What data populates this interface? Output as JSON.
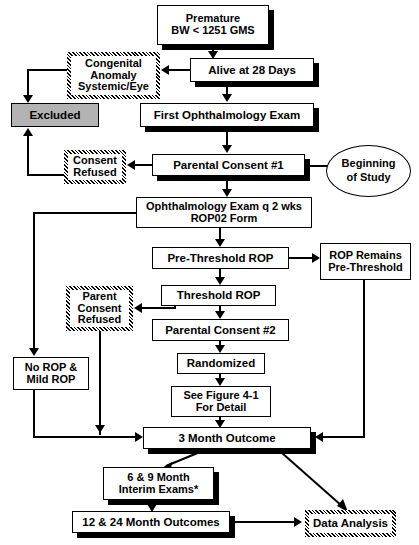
{
  "diagram": {
    "type": "flowchart",
    "colors": {
      "line": "#000000",
      "box_fill": "#ffffff",
      "excluded_fill": "#b3b3b3",
      "text": "#000000"
    },
    "nodes": [
      {
        "id": "premature",
        "label": "Premature\nBW < 1251 GMS",
        "style": "shadow",
        "x": 157,
        "y": 5,
        "w": 112,
        "h": 40,
        "font": 11
      },
      {
        "id": "congenital",
        "label": "Congenital\nAnomaly\nSystemic/Eye",
        "style": "hatch",
        "x": 67,
        "y": 52,
        "w": 93,
        "h": 47,
        "font": 11
      },
      {
        "id": "alive28",
        "label": "Alive at 28 Days",
        "style": "shadow",
        "x": 190,
        "y": 58,
        "w": 124,
        "h": 24,
        "font": 11.5
      },
      {
        "id": "excluded",
        "label": "Excluded",
        "style": "filled",
        "x": 11,
        "y": 103,
        "w": 88,
        "h": 24,
        "font": 11.5
      },
      {
        "id": "first_exam",
        "label": "First Ophthalmology  Exam",
        "style": "shadow",
        "x": 140,
        "y": 103,
        "w": 174,
        "h": 24,
        "font": 11.5
      },
      {
        "id": "consent_refused1",
        "label": "Consent\nRefused",
        "style": "hatch",
        "x": 64,
        "y": 150,
        "w": 62,
        "h": 34,
        "font": 11
      },
      {
        "id": "parental1",
        "label": "Parental Consent #1",
        "style": "shadow",
        "x": 152,
        "y": 154,
        "w": 153,
        "h": 22,
        "font": 11.5
      },
      {
        "id": "beginning",
        "label": "Beginning\nof Study",
        "style": "ellipse",
        "x": 326,
        "y": 145,
        "w": 85,
        "h": 52,
        "font": 11
      },
      {
        "id": "ophth_q2",
        "label": "Ophthalmology Exam q 2 wks\nROP02 Form",
        "style": "plain",
        "x": 136,
        "y": 197,
        "w": 176,
        "h": 31,
        "font": 11
      },
      {
        "id": "prethreshold",
        "label": "Pre-Threshold ROP",
        "style": "plain",
        "x": 152,
        "y": 247,
        "w": 137,
        "h": 22,
        "font": 11.5
      },
      {
        "id": "rop_remains",
        "label": "ROP Remains\nPre-Threshold",
        "style": "plain",
        "x": 320,
        "y": 243,
        "w": 91,
        "h": 37,
        "font": 11
      },
      {
        "id": "threshold",
        "label": "Threshold ROP",
        "style": "plain",
        "x": 161,
        "y": 285,
        "w": 115,
        "h": 21,
        "font": 11.5
      },
      {
        "id": "parent_refused2",
        "label": "Parent\nConsent\nRefused",
        "style": "hatch",
        "x": 66,
        "y": 286,
        "w": 67,
        "h": 45,
        "font": 11
      },
      {
        "id": "parental2",
        "label": "Parental Consent #2",
        "style": "plain",
        "x": 152,
        "y": 319,
        "w": 137,
        "h": 22,
        "font": 11.5
      },
      {
        "id": "randomized",
        "label": "Randomized",
        "style": "plain",
        "x": 177,
        "y": 353,
        "w": 88,
        "h": 21,
        "font": 11.5
      },
      {
        "id": "see_figure",
        "label": "See Figure 4-1\nFor Detail",
        "style": "plain",
        "x": 171,
        "y": 386,
        "w": 100,
        "h": 31,
        "font": 11
      },
      {
        "id": "no_rop",
        "label": "No ROP &\nMild ROP",
        "style": "plain",
        "x": 13,
        "y": 357,
        "w": 76,
        "h": 33,
        "font": 11
      },
      {
        "id": "three_month",
        "label": "3 Month Outcome",
        "style": "shadow",
        "x": 143,
        "y": 427,
        "w": 168,
        "h": 22,
        "font": 11.5
      },
      {
        "id": "interim",
        "label": "6 & 9 Month\nInterim Exams*",
        "style": "shadow",
        "x": 103,
        "y": 467,
        "w": 111,
        "h": 33,
        "font": 11
      },
      {
        "id": "outcomes_12_24",
        "label": "12 & 24 Month Outcomes",
        "style": "shadow",
        "x": 72,
        "y": 511,
        "w": 158,
        "h": 22,
        "font": 11.5
      },
      {
        "id": "data_analysis",
        "label": "Data Analysis",
        "style": "hatch",
        "x": 305,
        "y": 510,
        "w": 91,
        "h": 27,
        "font": 11.5
      }
    ],
    "edges": [
      {
        "from": "premature",
        "to": "alive28"
      },
      {
        "from": "alive28",
        "to": "congenital"
      },
      {
        "from": "congenital",
        "to": "excluded"
      },
      {
        "from": "alive28",
        "to": "first_exam"
      },
      {
        "from": "first_exam",
        "to": "parental1"
      },
      {
        "from": "parental1",
        "to": "consent_refused1"
      },
      {
        "from": "consent_refused1",
        "to": "excluded"
      },
      {
        "from": "beginning",
        "to": "parental1"
      },
      {
        "from": "parental1",
        "to": "ophth_q2"
      },
      {
        "from": "ophth_q2",
        "to": "prethreshold"
      },
      {
        "from": "ophth_q2",
        "to": "no_rop"
      },
      {
        "from": "prethreshold",
        "to": "rop_remains"
      },
      {
        "from": "prethreshold",
        "to": "threshold"
      },
      {
        "from": "threshold",
        "to": "parent_refused2"
      },
      {
        "from": "threshold",
        "to": "parental2"
      },
      {
        "from": "parental2",
        "to": "randomized"
      },
      {
        "from": "randomized",
        "to": "see_figure"
      },
      {
        "from": "see_figure",
        "to": "three_month"
      },
      {
        "from": "no_rop",
        "to": "three_month"
      },
      {
        "from": "parent_refused2",
        "to": "three_month"
      },
      {
        "from": "rop_remains",
        "to": "three_month"
      },
      {
        "from": "three_month",
        "to": "interim"
      },
      {
        "from": "three_month",
        "to": "data_analysis"
      },
      {
        "from": "interim",
        "to": "outcomes_12_24"
      },
      {
        "from": "outcomes_12_24",
        "to": "data_analysis"
      }
    ]
  }
}
